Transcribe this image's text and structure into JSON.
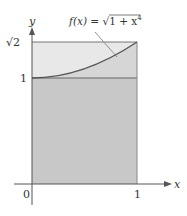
{
  "diagram": {
    "function_label": {
      "prefix": "f(x) = ",
      "radical": "√",
      "radicand": "1 + x",
      "exponent": "4"
    },
    "axes": {
      "x_label": "x",
      "y_label": "y",
      "x_ticks": [
        "0",
        "1"
      ],
      "y_ticks": [
        "1",
        "√2"
      ]
    },
    "regions": {
      "lower_rectangle": {
        "from_y": 0,
        "to_y": 1,
        "fill": "#c9c9c9"
      },
      "upper_band": {
        "from_y": 1,
        "to_y": "√2",
        "fill": "#e6e6e6"
      }
    },
    "curve": {
      "expression": "f(x) = √(1 + x⁴)",
      "x_range": [
        0,
        1
      ],
      "color": "#555555"
    },
    "colors": {
      "axis": "#444444",
      "outline": "#666666",
      "text": "#333333"
    }
  }
}
